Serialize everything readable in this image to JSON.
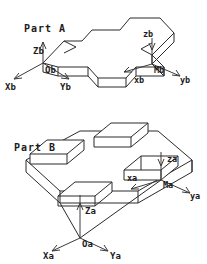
{
  "figure": {
    "title_a": "Part A",
    "title_b": "Part B",
    "background_color": "#ffffff",
    "line_color": "#2a2a2a",
    "text_color": "#1c1c1c"
  },
  "part_a": {
    "name": "Part A",
    "labels": {
      "zb_upper": "Zb",
      "ob": "Ob",
      "xb_upper": "Xb",
      "yb_upper": "Yb",
      "zb_lower": "zb",
      "mb": "Mb",
      "xb_lower": "xb",
      "yb_lower": "yb"
    }
  },
  "part_b": {
    "name": "Part B",
    "labels": {
      "za_upper": "Za",
      "oa": "Oa",
      "xa_upper": "Xa",
      "ya_upper": "Ya",
      "za_lower": "za",
      "ma": "Ma",
      "xa_lower": "xa",
      "ya_lower": "ya"
    }
  },
  "frames": [
    {
      "id": "Ob",
      "origin_label": "Ob",
      "axes": [
        "Xb",
        "Yb",
        "Zb"
      ],
      "belongs_to": "Part A",
      "kind": "base-frame"
    },
    {
      "id": "Mb",
      "origin_label": "Mb",
      "axes": [
        "xb",
        "yb",
        "zb"
      ],
      "belongs_to": "Part A",
      "kind": "mating-frame"
    },
    {
      "id": "Oa",
      "origin_label": "Oa",
      "axes": [
        "Xa",
        "Ya",
        "Za"
      ],
      "belongs_to": "Part B",
      "kind": "base-frame"
    },
    {
      "id": "Ma",
      "origin_label": "Ma",
      "axes": [
        "xa",
        "ya",
        "za"
      ],
      "belongs_to": "Part B",
      "kind": "mating-frame"
    }
  ]
}
